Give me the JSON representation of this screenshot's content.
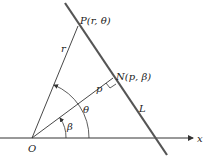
{
  "diagram": {
    "points": {
      "O": {
        "label": "O",
        "x": 32,
        "y": 138
      },
      "P": {
        "label": "P(r, θ)",
        "x": 78,
        "y": 26
      },
      "N": {
        "label": "N(p, β)",
        "x": 113,
        "y": 78
      }
    },
    "segments": {
      "r_label": "r",
      "p_label": "p",
      "line_label": "L"
    },
    "angles": {
      "theta_label": "θ",
      "beta_label": "β"
    },
    "axis": {
      "x_label": "x"
    },
    "colors": {
      "line_L": "#555555",
      "strokes": "#333333"
    }
  }
}
